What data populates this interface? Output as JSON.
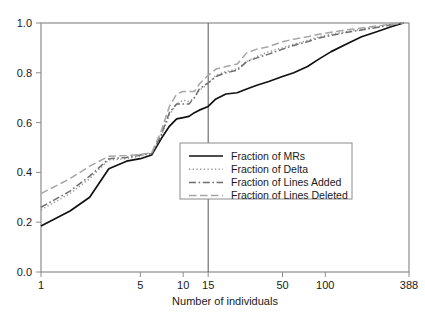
{
  "chart_data": {
    "type": "line",
    "title": "",
    "xlabel": "Number of individuals",
    "ylabel": "",
    "xscale": "log",
    "xlim": [
      1,
      388
    ],
    "ylim": [
      0.0,
      1.0
    ],
    "grid": false,
    "legend_position": "center",
    "xticks": [
      {
        "value": 1,
        "label": "1"
      },
      {
        "value": 5,
        "label": "5"
      },
      {
        "value": 10,
        "label": "10"
      },
      {
        "value": 15,
        "label": "15"
      },
      {
        "value": 50,
        "label": "50"
      },
      {
        "value": 100,
        "label": "100"
      },
      {
        "value": 388,
        "label": "388"
      }
    ],
    "yticks": [
      {
        "value": 0.0,
        "label": "0.0"
      },
      {
        "value": 0.2,
        "label": "0.2"
      },
      {
        "value": 0.4,
        "label": "0.4"
      },
      {
        "value": 0.6,
        "label": "0.6"
      },
      {
        "value": 0.8,
        "label": "0.8"
      },
      {
        "value": 1.0,
        "label": "1.0"
      }
    ],
    "annotations": [
      {
        "type": "vline",
        "x": 15,
        "label": "15",
        "color": "#555555"
      }
    ],
    "series": [
      {
        "name": "Fraction of MRs",
        "style": "solid",
        "color": "#111111",
        "x": [
          1,
          1.6,
          2.2,
          3,
          4,
          5,
          6,
          7,
          8,
          9,
          10,
          11,
          12,
          13,
          15,
          17,
          20,
          24,
          28,
          33,
          40,
          50,
          60,
          75,
          90,
          110,
          140,
          180,
          230,
          290,
          355
        ],
        "y": [
          0.185,
          0.245,
          0.3,
          0.415,
          0.445,
          0.455,
          0.47,
          0.535,
          0.585,
          0.615,
          0.62,
          0.625,
          0.64,
          0.65,
          0.665,
          0.695,
          0.715,
          0.72,
          0.735,
          0.75,
          0.765,
          0.785,
          0.8,
          0.825,
          0.855,
          0.885,
          0.915,
          0.945,
          0.965,
          0.985,
          1.0
        ]
      },
      {
        "name": "Fraction of Delta",
        "style": "dotted",
        "color": "#9a9a9a",
        "x": [
          1,
          1.6,
          2.2,
          3,
          4,
          5,
          6,
          7,
          8,
          9,
          10,
          11,
          12,
          13,
          15,
          17,
          20,
          24,
          28,
          33,
          40,
          50,
          60,
          75,
          90,
          110,
          140,
          180,
          230,
          290,
          355
        ],
        "y": [
          0.25,
          0.315,
          0.375,
          0.45,
          0.455,
          0.465,
          0.475,
          0.545,
          0.63,
          0.675,
          0.69,
          0.685,
          0.7,
          0.73,
          0.755,
          0.79,
          0.805,
          0.815,
          0.845,
          0.865,
          0.885,
          0.9,
          0.915,
          0.93,
          0.945,
          0.955,
          0.965,
          0.975,
          0.985,
          0.995,
          1.0
        ]
      },
      {
        "name": "Fraction of Lines Added",
        "style": "dashdot",
        "color": "#6e6e6e",
        "x": [
          1,
          1.6,
          2.2,
          3,
          4,
          5,
          6,
          7,
          8,
          9,
          10,
          11,
          12,
          13,
          15,
          17,
          20,
          24,
          28,
          33,
          40,
          50,
          60,
          75,
          90,
          110,
          140,
          180,
          230,
          290,
          355
        ],
        "y": [
          0.26,
          0.325,
          0.385,
          0.455,
          0.46,
          0.47,
          0.475,
          0.55,
          0.64,
          0.675,
          0.675,
          0.675,
          0.7,
          0.735,
          0.76,
          0.785,
          0.8,
          0.81,
          0.845,
          0.86,
          0.875,
          0.895,
          0.91,
          0.925,
          0.94,
          0.95,
          0.962,
          0.972,
          0.982,
          0.993,
          1.0
        ]
      },
      {
        "name": "Fraction of Lines Deleted",
        "style": "dashed",
        "color": "#a6a6a6",
        "x": [
          1,
          1.6,
          2.2,
          3,
          4,
          5,
          6,
          7,
          8,
          9,
          10,
          11,
          12,
          13,
          15,
          17,
          20,
          24,
          28,
          33,
          40,
          50,
          60,
          75,
          90,
          110,
          140,
          180,
          230,
          290,
          355
        ],
        "y": [
          0.315,
          0.375,
          0.425,
          0.465,
          0.468,
          0.472,
          0.478,
          0.565,
          0.665,
          0.715,
          0.725,
          0.725,
          0.725,
          0.755,
          0.79,
          0.815,
          0.825,
          0.835,
          0.88,
          0.895,
          0.905,
          0.925,
          0.935,
          0.945,
          0.955,
          0.963,
          0.972,
          0.98,
          0.988,
          0.995,
          1.0
        ]
      }
    ]
  },
  "legend": {
    "entries": [
      {
        "label": "Fraction of MRs"
      },
      {
        "label": "Fraction of Delta"
      },
      {
        "label": "Fraction of Lines Added"
      },
      {
        "label": "Fraction of Lines Deleted"
      }
    ]
  },
  "axes": {
    "x_title": "Number of individuals"
  }
}
